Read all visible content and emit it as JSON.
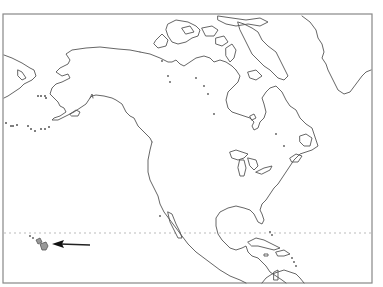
{
  "map": {
    "title": "Outline map of North America",
    "region": "North America",
    "projection": "conic outline",
    "colors": {
      "background": "#ffffff",
      "coastline": "#555555",
      "frame": "#888888",
      "tropic_line": "#bbbbbb",
      "hawaii_fill": "#999999",
      "arrow": "#111111"
    },
    "frame": {
      "x": 3,
      "y": 14,
      "width": 369,
      "height": 269
    },
    "reference_line": {
      "name": "Tropic of Cancer",
      "style": "dotted",
      "y": 233
    },
    "callout": {
      "target": "Hawaii",
      "direction": "left",
      "arrow_from": [
        90,
        245
      ],
      "arrow_to": [
        52,
        244
      ]
    },
    "features": [
      "Alaska",
      "Canada",
      "Greenland",
      "Hudson Bay",
      "Arctic Archipelago",
      "Great Lakes",
      "United States",
      "Gulf of Mexico",
      "Mexico",
      "Baja California",
      "Caribbean islands",
      "Central America",
      "Aleutian Islands",
      "Chukotka",
      "Hawaii"
    ]
  }
}
